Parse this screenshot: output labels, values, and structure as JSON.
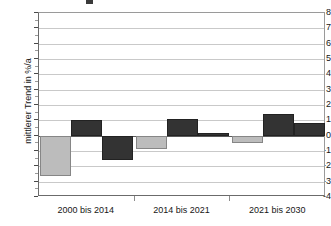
{
  "chart_data": {
    "type": "bar",
    "title": "",
    "xlabel": "",
    "ylabel": "mittlerer Trend in %/a",
    "ylim": [
      -4,
      8
    ],
    "ytick_step": 1,
    "yticks": [
      8,
      7,
      6,
      5,
      4,
      3,
      2,
      1,
      0,
      -1,
      -2,
      -3,
      -4
    ],
    "ytick_labels": [
      "8",
      "7",
      "6",
      "5",
      "4",
      "3",
      "2",
      "1",
      "0",
      "-1",
      "-2",
      "-3",
      "-4"
    ],
    "grid": true,
    "legend": "none",
    "categories": [
      "2000 bis 2014",
      "2014 bis 2021",
      "2021 bis 2030"
    ],
    "series": [
      {
        "name": "series-1",
        "color": "#bcbcbc",
        "values": [
          -2.6,
          -0.9,
          -0.5
        ]
      },
      {
        "name": "series-2",
        "color": "#333333",
        "values": [
          1.0,
          1.1,
          1.4
        ]
      },
      {
        "name": "series-3",
        "color": "#333333",
        "values": [
          -1.6,
          0.2,
          0.85
        ]
      }
    ]
  },
  "colors": {
    "light_bar": "#bcbcbc",
    "light_bar_border": "#868686",
    "dark_bar": "#333333",
    "dark_bar_border": "#222222",
    "gridline": "#c9c9c9",
    "zero_line": "#5a5a5a",
    "axis": "#6b6b6b",
    "text": "#161616",
    "background": "#ffffff"
  }
}
